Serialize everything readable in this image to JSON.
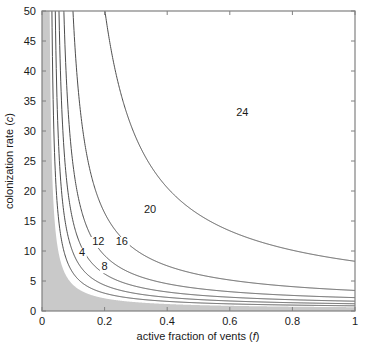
{
  "chart_data": {
    "type": "line",
    "title": "",
    "xlabel": "active fraction of vents (f)",
    "xlabel_text": "active fraction of vents (",
    "xlabel_italic": "f",
    "xlabel_close": ")",
    "ylabel_text": "colonization rate (",
    "ylabel_italic": "c",
    "ylabel_close": ")",
    "xlim": [
      0,
      1
    ],
    "ylim": [
      0,
      50
    ],
    "xticks": [
      0,
      0.2,
      0.4,
      0.6,
      0.8,
      1
    ],
    "xticklabels": [
      "0",
      "0.2",
      "0.4",
      "0.6",
      "0.8",
      "1"
    ],
    "yticks": [
      0,
      5,
      10,
      15,
      20,
      25,
      30,
      35,
      40,
      45,
      50
    ],
    "yticklabels": [
      "0",
      "5",
      "10",
      "15",
      "20",
      "25",
      "30",
      "35",
      "40",
      "45",
      "50"
    ],
    "grid": false,
    "legend": "none",
    "plot_style": "contour",
    "shaded_region": {
      "label": "extinction region",
      "color": "#c9c9c9",
      "description": "grey shaded area below the lowest contour level"
    },
    "contour_levels": [
      4,
      8,
      12,
      16,
      20,
      24
    ],
    "contour_labels": [
      {
        "level": "4",
        "x": 0.128,
        "y": 9.2
      },
      {
        "level": "8",
        "x": 0.2,
        "y": 6.8
      },
      {
        "level": "12",
        "x": 0.18,
        "y": 11.0
      },
      {
        "level": "16",
        "x": 0.255,
        "y": 11.0
      },
      {
        "level": "20",
        "x": 0.345,
        "y": 16.3
      },
      {
        "level": "24",
        "x": 0.64,
        "y": 32.5
      }
    ],
    "series": [
      {
        "name": "contour-4",
        "level": 4,
        "color": "#4d4d4d"
      },
      {
        "name": "contour-8",
        "level": 8,
        "color": "#4d4d4d"
      },
      {
        "name": "contour-12",
        "level": 12,
        "color": "#4d4d4d"
      },
      {
        "name": "contour-16",
        "level": 16,
        "color": "#4d4d4d"
      },
      {
        "name": "contour-20",
        "level": 20,
        "color": "#4d4d4d"
      },
      {
        "name": "contour-24",
        "level": 24,
        "color": "#4d4d4d"
      }
    ],
    "contour_params": [
      {
        "level": 4,
        "a": 0.455,
        "b": 0.0225,
        "c0": 0.4
      },
      {
        "level": 8,
        "a": 0.64,
        "b": 0.0295,
        "c0": 0.55
      },
      {
        "level": 12,
        "a": 0.9,
        "b": 0.036,
        "c0": 0.7
      },
      {
        "level": 16,
        "a": 1.32,
        "b": 0.043,
        "c0": 0.85
      },
      {
        "level": 20,
        "a": 2.25,
        "b": 0.053,
        "c0": 1.05
      },
      {
        "level": 24,
        "a": 6.2,
        "b": 0.073,
        "c0": 1.6
      }
    ],
    "boundary_params": {
      "a": 0.33,
      "b": 0.018,
      "c0": 0.3
    }
  },
  "plot_geometry": {
    "left": 42,
    "right": 355,
    "top": 11,
    "bottom": 311
  }
}
